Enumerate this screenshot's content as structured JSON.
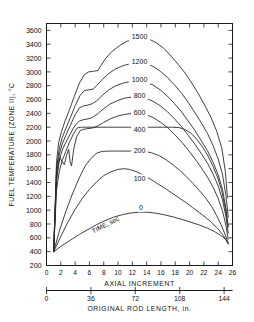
{
  "chart_data": {
    "type": "line",
    "title": "",
    "xlabel": "AXIAL INCREMENT",
    "xlabel2": "ORIGINAL ROD LENGTH, in.",
    "ylabel": "FUEL TEMPERATURE (ZONE II), °C",
    "xlim": [
      0,
      26
    ],
    "ylim": [
      200,
      3700
    ],
    "xticks": [
      0,
      2,
      4,
      6,
      8,
      10,
      12,
      14,
      16,
      18,
      20,
      22,
      24,
      26
    ],
    "xticklabels": [
      "0",
      "2",
      "4",
      "6",
      "8",
      "10",
      "12",
      "14",
      "16",
      "18",
      "20",
      "22",
      "24",
      "26"
    ],
    "x2ticks": [
      0,
      36,
      72,
      108,
      144
    ],
    "x2ticklabels": [
      "0",
      "36",
      "72",
      "108",
      "144"
    ],
    "x2lim": [
      0,
      150.8
    ],
    "yticks": [
      200,
      400,
      600,
      800,
      1000,
      1200,
      1400,
      1600,
      1800,
      2000,
      2200,
      2400,
      2600,
      2800,
      3000,
      3200,
      3400,
      3600
    ],
    "yticklabels": [
      "200",
      "400",
      "600",
      "800",
      "1000",
      "1200",
      "1400",
      "1600",
      "1800",
      "2000",
      "2200",
      "2400",
      "2600",
      "2800",
      "3000",
      "3200",
      "3400",
      "3600"
    ],
    "grid": false,
    "legend_position": "inline-curve-labels",
    "series_annotation": "TIME, sec",
    "series_annotation_x": 8.4,
    "series_annotation_y": 760,
    "series": [
      {
        "name": "1500",
        "label": "1500",
        "label_x": 13.0,
        "label_y": 3490,
        "points": [
          [
            1.0,
            400
          ],
          [
            1.4,
            1700
          ],
          [
            1.7,
            1980
          ],
          [
            2.1,
            2140
          ],
          [
            2.6,
            2290
          ],
          [
            3.2,
            2450
          ],
          [
            3.9,
            2650
          ],
          [
            4.6,
            2840
          ],
          [
            5.3,
            2960
          ],
          [
            5.9,
            3000
          ],
          [
            6.6,
            3010
          ],
          [
            7.2,
            3020
          ],
          [
            7.6,
            3090
          ],
          [
            8.3,
            3200
          ],
          [
            9.2,
            3300
          ],
          [
            10.2,
            3380
          ],
          [
            11.2,
            3440
          ],
          [
            12.3,
            3480
          ],
          [
            13.4,
            3490
          ],
          [
            14.4,
            3470
          ],
          [
            15.4,
            3420
          ],
          [
            16.4,
            3340
          ],
          [
            17.4,
            3230
          ],
          [
            18.4,
            3110
          ],
          [
            19.4,
            2980
          ],
          [
            20.3,
            2840
          ],
          [
            21.2,
            2690
          ],
          [
            22.1,
            2520
          ],
          [
            23.0,
            2340
          ],
          [
            23.8,
            2140
          ],
          [
            24.5,
            1900
          ],
          [
            25.0,
            1560
          ],
          [
            25.3,
            1180
          ]
        ]
      },
      {
        "name": "1200",
        "label": "1200",
        "label_x": 13.0,
        "label_y": 3130,
        "points": [
          [
            1.0,
            400
          ],
          [
            1.4,
            1600
          ],
          [
            1.8,
            1900
          ],
          [
            2.2,
            2050
          ],
          [
            2.7,
            2180
          ],
          [
            3.3,
            2330
          ],
          [
            4.0,
            2510
          ],
          [
            4.7,
            2660
          ],
          [
            5.3,
            2730
          ],
          [
            5.9,
            2740
          ],
          [
            6.5,
            2750
          ],
          [
            7.0,
            2800
          ],
          [
            7.7,
            2880
          ],
          [
            8.6,
            2970
          ],
          [
            9.6,
            3040
          ],
          [
            10.7,
            3090
          ],
          [
            11.8,
            3120
          ],
          [
            12.9,
            3130
          ],
          [
            13.9,
            3120
          ],
          [
            14.9,
            3080
          ],
          [
            15.9,
            3010
          ],
          [
            16.9,
            2920
          ],
          [
            17.9,
            2810
          ],
          [
            18.9,
            2690
          ],
          [
            19.8,
            2560
          ],
          [
            20.7,
            2420
          ],
          [
            21.6,
            2270
          ],
          [
            22.5,
            2110
          ],
          [
            23.3,
            1930
          ],
          [
            24.0,
            1740
          ],
          [
            24.6,
            1520
          ],
          [
            25.1,
            1200
          ],
          [
            25.4,
            900
          ]
        ]
      },
      {
        "name": "1000",
        "label": "1000",
        "label_x": 13.0,
        "label_y": 2870,
        "points": [
          [
            1.0,
            400
          ],
          [
            1.4,
            1520
          ],
          [
            1.8,
            1810
          ],
          [
            2.2,
            1960
          ],
          [
            2.7,
            2080
          ],
          [
            3.3,
            2220
          ],
          [
            4.0,
            2380
          ],
          [
            4.6,
            2480
          ],
          [
            5.2,
            2510
          ],
          [
            5.8,
            2520
          ],
          [
            6.4,
            2540
          ],
          [
            7.0,
            2580
          ],
          [
            7.8,
            2660
          ],
          [
            8.7,
            2740
          ],
          [
            9.7,
            2800
          ],
          [
            10.8,
            2840
          ],
          [
            11.9,
            2865
          ],
          [
            12.9,
            2870
          ],
          [
            13.9,
            2855
          ],
          [
            14.9,
            2810
          ],
          [
            15.9,
            2740
          ],
          [
            16.9,
            2650
          ],
          [
            17.9,
            2540
          ],
          [
            18.9,
            2420
          ],
          [
            19.8,
            2290
          ],
          [
            20.7,
            2160
          ],
          [
            21.6,
            2010
          ],
          [
            22.5,
            1860
          ],
          [
            23.3,
            1690
          ],
          [
            24.0,
            1510
          ],
          [
            24.6,
            1300
          ],
          [
            25.1,
            1020
          ],
          [
            25.4,
            760
          ]
        ]
      },
      {
        "name": "800",
        "label": "800",
        "label_x": 13.0,
        "label_y": 2640,
        "points": [
          [
            1.0,
            400
          ],
          [
            1.4,
            1440
          ],
          [
            1.8,
            1730
          ],
          [
            2.2,
            1870
          ],
          [
            2.7,
            1980
          ],
          [
            3.3,
            2100
          ],
          [
            4.0,
            2230
          ],
          [
            4.6,
            2290
          ],
          [
            5.2,
            2310
          ],
          [
            5.8,
            2320
          ],
          [
            6.4,
            2340
          ],
          [
            7.1,
            2390
          ],
          [
            7.9,
            2460
          ],
          [
            8.8,
            2530
          ],
          [
            9.8,
            2580
          ],
          [
            10.9,
            2620
          ],
          [
            11.9,
            2635
          ],
          [
            12.9,
            2640
          ],
          [
            13.9,
            2620
          ],
          [
            14.9,
            2575
          ],
          [
            15.9,
            2510
          ],
          [
            16.9,
            2425
          ],
          [
            17.9,
            2320
          ],
          [
            18.9,
            2205
          ],
          [
            19.8,
            2085
          ],
          [
            20.7,
            1960
          ],
          [
            21.6,
            1825
          ],
          [
            22.5,
            1680
          ],
          [
            23.3,
            1520
          ],
          [
            24.0,
            1350
          ],
          [
            24.6,
            1150
          ],
          [
            25.1,
            900
          ],
          [
            25.4,
            670
          ]
        ]
      },
      {
        "name": "600",
        "label": "600",
        "label_x": 13.0,
        "label_y": 2400,
        "points": [
          [
            1.0,
            400
          ],
          [
            1.35,
            1350
          ],
          [
            1.6,
            1640
          ],
          [
            1.9,
            1760
          ],
          [
            2.2,
            1700
          ],
          [
            2.5,
            1660
          ],
          [
            2.8,
            1790
          ],
          [
            3.1,
            1880
          ],
          [
            3.3,
            1700
          ],
          [
            3.5,
            1640
          ],
          [
            3.8,
            1880
          ],
          [
            4.2,
            2060
          ],
          [
            4.7,
            2150
          ],
          [
            5.2,
            2170
          ],
          [
            5.8,
            2180
          ],
          [
            6.5,
            2190
          ],
          [
            7.2,
            2220
          ],
          [
            8.0,
            2270
          ],
          [
            8.9,
            2320
          ],
          [
            9.9,
            2360
          ],
          [
            10.9,
            2385
          ],
          [
            11.9,
            2398
          ],
          [
            12.9,
            2400
          ],
          [
            13.9,
            2380
          ],
          [
            14.9,
            2340
          ],
          [
            15.9,
            2275
          ],
          [
            16.9,
            2195
          ],
          [
            17.9,
            2095
          ],
          [
            18.9,
            1985
          ],
          [
            19.8,
            1870
          ],
          [
            20.7,
            1750
          ],
          [
            21.6,
            1620
          ],
          [
            22.5,
            1480
          ],
          [
            23.3,
            1330
          ],
          [
            24.0,
            1170
          ],
          [
            24.6,
            990
          ],
          [
            25.1,
            770
          ],
          [
            25.4,
            580
          ]
        ]
      },
      {
        "name": "400",
        "label": "400",
        "label_x": 13.0,
        "label_y": 2155,
        "points": [
          [
            1.0,
            400
          ],
          [
            1.4,
            1290
          ],
          [
            1.8,
            1570
          ],
          [
            2.2,
            1720
          ],
          [
            2.7,
            1850
          ],
          [
            3.2,
            1980
          ],
          [
            3.8,
            2110
          ],
          [
            4.3,
            2190
          ],
          [
            4.9,
            2200
          ],
          [
            5.6,
            2200
          ],
          [
            6.5,
            2200
          ],
          [
            7.5,
            2200
          ],
          [
            8.5,
            2200
          ],
          [
            9.5,
            2200
          ],
          [
            10.5,
            2200
          ],
          [
            11.5,
            2200
          ],
          [
            12.5,
            2200
          ],
          [
            13.5,
            2200
          ],
          [
            14.5,
            2200
          ],
          [
            15.5,
            2200
          ],
          [
            16.5,
            2200
          ],
          [
            17.5,
            2200
          ],
          [
            18.5,
            2195
          ],
          [
            19.3,
            2170
          ],
          [
            20.1,
            2120
          ],
          [
            20.9,
            2040
          ],
          [
            21.7,
            1930
          ],
          [
            22.5,
            1800
          ],
          [
            23.2,
            1650
          ],
          [
            23.9,
            1480
          ],
          [
            24.5,
            1280
          ],
          [
            25.0,
            1020
          ],
          [
            25.4,
            760
          ]
        ]
      },
      {
        "name": "200",
        "label": "200",
        "label_x": 13.0,
        "label_y": 1850,
        "points": [
          [
            1.0,
            400
          ],
          [
            1.8,
            700
          ],
          [
            2.7,
            980
          ],
          [
            3.6,
            1230
          ],
          [
            4.5,
            1450
          ],
          [
            5.4,
            1640
          ],
          [
            6.3,
            1760
          ],
          [
            7.1,
            1830
          ],
          [
            7.8,
            1850
          ],
          [
            8.7,
            1855
          ],
          [
            9.7,
            1855
          ],
          [
            10.7,
            1855
          ],
          [
            11.7,
            1855
          ],
          [
            12.7,
            1855
          ],
          [
            13.7,
            1850
          ],
          [
            14.7,
            1830
          ],
          [
            15.7,
            1790
          ],
          [
            16.7,
            1730
          ],
          [
            17.7,
            1655
          ],
          [
            18.7,
            1570
          ],
          [
            19.6,
            1480
          ],
          [
            20.5,
            1385
          ],
          [
            21.4,
            1280
          ],
          [
            22.3,
            1170
          ],
          [
            23.1,
            1050
          ],
          [
            23.8,
            920
          ],
          [
            24.4,
            790
          ],
          [
            25.0,
            640
          ],
          [
            25.4,
            520
          ]
        ]
      },
      {
        "name": "100",
        "label": "100",
        "label_x": 13.0,
        "label_y": 1440,
        "points": [
          [
            1.0,
            400
          ],
          [
            2.0,
            620
          ],
          [
            3.0,
            830
          ],
          [
            4.0,
            1010
          ],
          [
            5.0,
            1170
          ],
          [
            6.0,
            1300
          ],
          [
            7.0,
            1410
          ],
          [
            8.0,
            1500
          ],
          [
            9.0,
            1555
          ],
          [
            10.0,
            1590
          ],
          [
            10.8,
            1600
          ],
          [
            11.6,
            1590
          ],
          [
            12.5,
            1560
          ],
          [
            13.5,
            1510
          ],
          [
            14.5,
            1450
          ],
          [
            15.5,
            1385
          ],
          [
            16.5,
            1320
          ],
          [
            17.5,
            1250
          ],
          [
            18.5,
            1180
          ],
          [
            19.5,
            1110
          ],
          [
            20.4,
            1040
          ],
          [
            21.3,
            970
          ],
          [
            22.2,
            900
          ],
          [
            23.1,
            820
          ],
          [
            23.9,
            740
          ],
          [
            24.6,
            650
          ],
          [
            25.1,
            570
          ],
          [
            25.4,
            510
          ]
        ]
      },
      {
        "name": "0",
        "label": "0",
        "label_x": 13.2,
        "label_y": 1020,
        "points": [
          [
            1.0,
            400
          ],
          [
            2.2,
            490
          ],
          [
            3.4,
            570
          ],
          [
            4.6,
            650
          ],
          [
            5.8,
            720
          ],
          [
            7.0,
            790
          ],
          [
            8.2,
            850
          ],
          [
            9.4,
            900
          ],
          [
            10.6,
            935
          ],
          [
            11.8,
            960
          ],
          [
            13.0,
            972
          ],
          [
            14.2,
            970
          ],
          [
            15.4,
            955
          ],
          [
            16.6,
            930
          ],
          [
            17.8,
            900
          ],
          [
            19.0,
            865
          ],
          [
            20.2,
            825
          ],
          [
            21.4,
            785
          ],
          [
            22.5,
            740
          ],
          [
            23.5,
            690
          ],
          [
            24.3,
            640
          ],
          [
            25.0,
            580
          ],
          [
            25.4,
            530
          ]
        ]
      }
    ]
  }
}
